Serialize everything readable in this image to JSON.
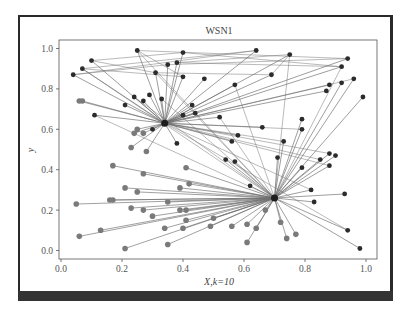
{
  "chart_data": {
    "type": "scatter",
    "title": "WSN1",
    "xlabel": "X,k=10",
    "ylabel": "y",
    "xlim": [
      -0.01,
      1.03
    ],
    "ylim": [
      -0.03,
      1.04
    ],
    "xticks": [
      "0.0",
      "0.2",
      "0.4",
      "0.6",
      "0.8",
      "1.0"
    ],
    "yticks": [
      "0.0",
      "0.2",
      "0.4",
      "0.6",
      "0.8",
      "1.0"
    ],
    "grid": false,
    "legend": null,
    "colors": {
      "dark_node": "#2b2b2b",
      "light_node": "#7a7a7a",
      "edge": "#6e6e6e",
      "frame": "#2a2a2a"
    },
    "cluster_heads": [
      {
        "name": "CH1",
        "x": 0.34,
        "y": 0.63
      },
      {
        "name": "CH2",
        "x": 0.7,
        "y": 0.26
      }
    ],
    "series": [
      {
        "name": "dark nodes",
        "points": [
          [
            0.25,
            0.99
          ],
          [
            0.4,
            0.98
          ],
          [
            0.64,
            0.99
          ],
          [
            0.75,
            0.97
          ],
          [
            0.94,
            0.95
          ],
          [
            0.1,
            0.94
          ],
          [
            0.07,
            0.9
          ],
          [
            0.38,
            0.93
          ],
          [
            0.35,
            0.92
          ],
          [
            0.31,
            0.88
          ],
          [
            0.4,
            0.86
          ],
          [
            0.47,
            0.85
          ],
          [
            0.92,
            0.91
          ],
          [
            0.04,
            0.87
          ],
          [
            0.69,
            0.87
          ],
          [
            0.96,
            0.85
          ],
          [
            0.92,
            0.83
          ],
          [
            0.88,
            0.82
          ],
          [
            0.57,
            0.82
          ],
          [
            0.87,
            0.79
          ],
          [
            0.99,
            0.76
          ],
          [
            0.24,
            0.76
          ],
          [
            0.29,
            0.77
          ],
          [
            0.27,
            0.74
          ],
          [
            0.33,
            0.75
          ],
          [
            0.21,
            0.72
          ],
          [
            0.43,
            0.72
          ],
          [
            0.11,
            0.67
          ],
          [
            0.4,
            0.67
          ],
          [
            0.44,
            0.68
          ],
          [
            0.52,
            0.66
          ],
          [
            0.79,
            0.65
          ],
          [
            0.66,
            0.61
          ],
          [
            0.79,
            0.6
          ],
          [
            0.3,
            0.6
          ],
          [
            0.58,
            0.57
          ],
          [
            0.73,
            0.54
          ],
          [
            0.38,
            0.53
          ],
          [
            0.56,
            0.54
          ],
          [
            0.88,
            0.48
          ],
          [
            0.9,
            0.47
          ],
          [
            0.71,
            0.46
          ],
          [
            0.85,
            0.45
          ],
          [
            0.54,
            0.45
          ],
          [
            0.57,
            0.44
          ],
          [
            0.88,
            0.42
          ],
          [
            0.79,
            0.41
          ],
          [
            0.62,
            0.32
          ],
          [
            0.82,
            0.3
          ],
          [
            0.93,
            0.28
          ],
          [
            0.83,
            0.24
          ],
          [
            0.94,
            0.1
          ],
          [
            0.98,
            0.01
          ]
        ]
      },
      {
        "name": "light nodes",
        "points": [
          [
            0.06,
            0.74
          ],
          [
            0.07,
            0.74
          ],
          [
            0.25,
            0.6
          ],
          [
            0.24,
            0.58
          ],
          [
            0.27,
            0.58
          ],
          [
            0.23,
            0.51
          ],
          [
            0.28,
            0.49
          ],
          [
            0.17,
            0.42
          ],
          [
            0.27,
            0.38
          ],
          [
            0.41,
            0.41
          ],
          [
            0.42,
            0.33
          ],
          [
            0.39,
            0.31
          ],
          [
            0.21,
            0.31
          ],
          [
            0.25,
            0.29
          ],
          [
            0.16,
            0.25
          ],
          [
            0.17,
            0.25
          ],
          [
            0.05,
            0.23
          ],
          [
            0.35,
            0.24
          ],
          [
            0.23,
            0.21
          ],
          [
            0.27,
            0.2
          ],
          [
            0.39,
            0.2
          ],
          [
            0.41,
            0.2
          ],
          [
            0.3,
            0.17
          ],
          [
            0.5,
            0.16
          ],
          [
            0.41,
            0.15
          ],
          [
            0.34,
            0.11
          ],
          [
            0.4,
            0.11
          ],
          [
            0.49,
            0.12
          ],
          [
            0.56,
            0.12
          ],
          [
            0.61,
            0.13
          ],
          [
            0.64,
            0.11
          ],
          [
            0.72,
            0.14
          ],
          [
            0.13,
            0.1
          ],
          [
            0.06,
            0.07
          ],
          [
            0.21,
            0.01
          ],
          [
            0.35,
            0.03
          ],
          [
            0.61,
            0.04
          ],
          [
            0.74,
            0.06
          ],
          [
            0.77,
            0.08
          ],
          [
            0.67,
            0.2
          ]
        ]
      }
    ],
    "annotations": []
  }
}
